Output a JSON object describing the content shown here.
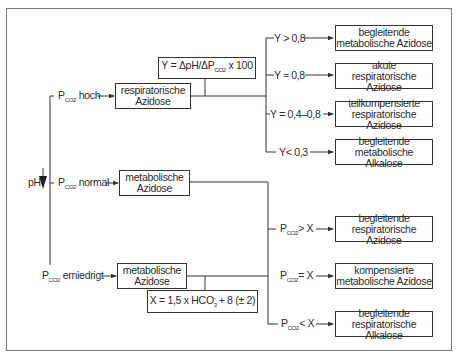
{
  "diagram": {
    "root": {
      "label": "pH",
      "arrow": "down"
    },
    "branches": [
      {
        "condition": {
          "prefix": "P",
          "sub": "CO2",
          "text": "hoch"
        },
        "result": [
          "respiratorische",
          "Azidose"
        ],
        "formula": {
          "text_a": "Y = ΔpH/ΔP",
          "sub": "CO2",
          "text_b": " x 100"
        },
        "outcomes": [
          {
            "condition": "Y > 0,8",
            "result": [
              "begleitende",
              "metabolische Azidose"
            ]
          },
          {
            "condition": "Y ≈ 0,8",
            "result": [
              "akute",
              "respiratorische Azidose"
            ]
          },
          {
            "condition": "Y = 0,4–0,8",
            "result": [
              "teilkompensierte",
              "respiratorische Azidose"
            ]
          },
          {
            "condition": "Y< 0,3",
            "result": [
              "begleitende",
              "metabolische Alkalose"
            ]
          }
        ]
      },
      {
        "condition": {
          "prefix": "P",
          "sub": "CO2",
          "text": "normal"
        },
        "result": [
          "metabolische",
          "Azidose"
        ]
      },
      {
        "condition": {
          "prefix": "P",
          "sub": "CO2",
          "text": "erniedrigt"
        },
        "result": [
          "metabolische",
          "Azidose"
        ],
        "formula": {
          "text_a": "X = 1,5 x HCO",
          "sub": "3",
          "sup": "−",
          "text_b": " + 8 (± 2)"
        },
        "outcomes": [
          {
            "prefix": "P",
            "sub": "CO2",
            "condition": "> X",
            "result": [
              "begleitende",
              "respiratorische Azidose"
            ]
          },
          {
            "prefix": "P",
            "sub": "CO2",
            "condition": "= X",
            "result": [
              "kompensierte",
              "metabolische Azidose"
            ]
          },
          {
            "prefix": "P",
            "sub": "CO2",
            "condition": "< X",
            "result": [
              "begleitende",
              "respiratorische Alkalose"
            ]
          }
        ]
      }
    ],
    "colors": {
      "line": "#333333",
      "frame": "#7a7a7a",
      "text": "#2a2a2a",
      "background": "#ffffff"
    }
  }
}
